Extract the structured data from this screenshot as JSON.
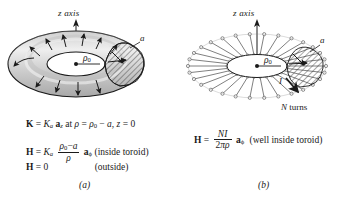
{
  "figure": {
    "panel_a": {
      "caption": "(a)",
      "axis_label": "z axis",
      "rho_label": "ρ",
      "rho_subscript": "0",
      "radius_label": "a",
      "equations": {
        "line1": {
          "lhs": "K",
          "eq": "=",
          "k_sym": "K",
          "k_sub": "a",
          "unit_vec": "a",
          "unit_sub": "z",
          "at": "at",
          "rho": "ρ",
          "eq2": "=",
          "rho2": "ρ",
          "rho2_sub": "0",
          "minus": "−",
          "a": "a",
          "comma": ",",
          "z": "z",
          "eq3": "=",
          "zero": "0"
        },
        "line2": {
          "lhs": "H",
          "eq": "=",
          "k_sym": "K",
          "k_sub": "a",
          "num_rho": "ρ",
          "num_sub": "0",
          "num_minus": "−",
          "num_a": "a",
          "den": "ρ",
          "unit_vec": "a",
          "unit_sub": "ϕ",
          "note": "(inside toroid)"
        },
        "line3": {
          "lhs": "H",
          "eq": "=",
          "value": "0",
          "note": "(outside)"
        }
      }
    },
    "panel_b": {
      "caption": "(b)",
      "axis_label": "z axis",
      "rho_label": "ρ",
      "rho_subscript": "0",
      "radius_label": "a",
      "current_label": "I",
      "turns_label_n": "N",
      "turns_label_text": " turns",
      "equation": {
        "lhs": "H",
        "eq": "=",
        "num_n": "N",
        "num_i": "I",
        "den_2": "2",
        "den_pi": "π",
        "den_rho": "ρ",
        "unit_vec": "a",
        "unit_sub": "ϕ",
        "note": "(well inside toroid)"
      }
    }
  },
  "colors": {
    "ink": "#1a1a1a",
    "torus_fill": "#d8d8d8",
    "torus_highlight": "#f0f0f0",
    "torus_shadow": "#b4b4b4",
    "hatch": "#2a2a2a",
    "background": "#ffffff"
  }
}
